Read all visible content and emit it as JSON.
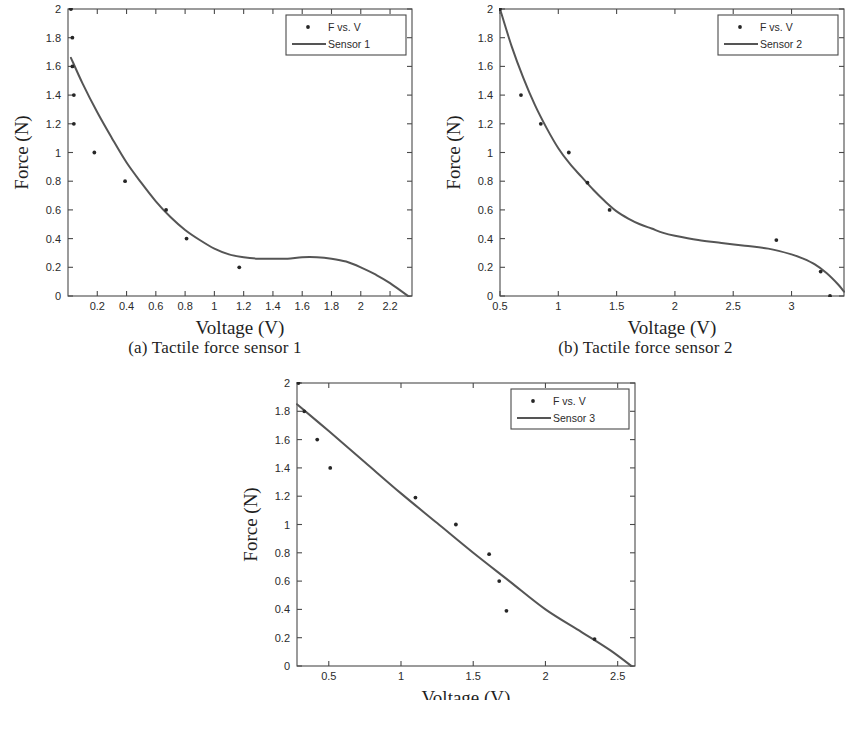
{
  "figure": {
    "background_color": "#ffffff",
    "ink_color": "#333333"
  },
  "panels": [
    {
      "id": "a",
      "caption": "(a) Tactile force sensor 1",
      "xlabel": "Voltage (V)",
      "ylabel": "Force (N)",
      "legend": {
        "marker_label": "F vs. V",
        "line_label": "Sensor 1"
      }
    },
    {
      "id": "b",
      "caption": "(b) Tactile force sensor 2",
      "xlabel": "Voltage (V)",
      "ylabel": "Force (N)",
      "legend": {
        "marker_label": "F vs. V",
        "line_label": "Sensor 2"
      }
    },
    {
      "id": "c",
      "caption": "(c) Tactile force sensor 3",
      "xlabel": "Voltage (V)",
      "ylabel": "Force (N)",
      "legend": {
        "marker_label": "F vs. V",
        "line_label": "Sensor 3"
      }
    }
  ],
  "chart_data": [
    {
      "type": "scatter",
      "id": "a",
      "title": "(a) Tactile force sensor 1",
      "xlabel": "Voltage (V)",
      "ylabel": "Force (N)",
      "xlim": [
        0.0,
        2.35
      ],
      "ylim": [
        0,
        2
      ],
      "xticks": [
        0.2,
        0.4,
        0.6,
        0.8,
        1,
        1.2,
        1.4,
        1.6,
        1.8,
        2,
        2.2
      ],
      "xtick_labels": [
        "0.2",
        "0.4",
        "0.6",
        "0.8",
        "1",
        "1.2",
        "1.4",
        "1.6",
        "1.8",
        "2",
        "2.2"
      ],
      "yticks": [
        0,
        0.2,
        0.4,
        0.6,
        0.8,
        1,
        1.2,
        1.4,
        1.6,
        1.8,
        2
      ],
      "ytick_labels": [
        "0",
        "0.2",
        "0.4",
        "0.6",
        "0.8",
        "1",
        "1.2",
        "1.4",
        "1.6",
        "1.8",
        "2"
      ],
      "grid": false,
      "legend_position": "top-right",
      "series": [
        {
          "name": "F vs. V",
          "kind": "scatter",
          "points": [
            [
              0.02,
              2.0
            ],
            [
              0.03,
              1.8
            ],
            [
              0.03,
              1.6
            ],
            [
              0.04,
              1.4
            ],
            [
              0.04,
              1.2
            ],
            [
              0.18,
              1.0
            ],
            [
              0.39,
              0.8
            ],
            [
              0.67,
              0.6
            ],
            [
              0.81,
              0.4
            ],
            [
              1.17,
              0.2
            ]
          ]
        },
        {
          "name": "Sensor 1",
          "kind": "fit-curve",
          "points": [
            [
              0.02,
              1.66
            ],
            [
              0.1,
              1.48
            ],
            [
              0.2,
              1.28
            ],
            [
              0.3,
              1.1
            ],
            [
              0.4,
              0.93
            ],
            [
              0.5,
              0.79
            ],
            [
              0.6,
              0.66
            ],
            [
              0.7,
              0.55
            ],
            [
              0.8,
              0.46
            ],
            [
              0.9,
              0.39
            ],
            [
              1.0,
              0.33
            ],
            [
              1.1,
              0.29
            ],
            [
              1.2,
              0.27
            ],
            [
              1.3,
              0.26
            ],
            [
              1.4,
              0.26
            ],
            [
              1.5,
              0.26
            ],
            [
              1.6,
              0.27
            ],
            [
              1.7,
              0.27
            ],
            [
              1.8,
              0.26
            ],
            [
              1.9,
              0.24
            ],
            [
              2.0,
              0.2
            ],
            [
              2.1,
              0.15
            ],
            [
              2.2,
              0.09
            ],
            [
              2.35,
              -0.02
            ]
          ]
        }
      ]
    },
    {
      "type": "scatter",
      "id": "b",
      "title": "(b) Tactile force sensor 2",
      "xlabel": "Voltage (V)",
      "ylabel": "Force (N)",
      "xlim": [
        0.5,
        3.45
      ],
      "ylim": [
        0,
        2
      ],
      "xticks": [
        0.5,
        1,
        1.5,
        2,
        2.5,
        3
      ],
      "xtick_labels": [
        "0.5",
        "1",
        "1.5",
        "2",
        "2.5",
        "3"
      ],
      "yticks": [
        0,
        0.2,
        0.4,
        0.6,
        0.8,
        1,
        1.2,
        1.4,
        1.6,
        1.8,
        2
      ],
      "ytick_labels": [
        "0",
        "0.2",
        "0.4",
        "0.6",
        "0.8",
        "1",
        "1.2",
        "1.4",
        "1.6",
        "1.8",
        "2"
      ],
      "grid": false,
      "legend_position": "top-right",
      "series": [
        {
          "name": "F vs. V",
          "kind": "scatter",
          "points": [
            [
              0.5,
              2.0
            ],
            [
              0.68,
              1.4
            ],
            [
              0.85,
              1.2
            ],
            [
              1.09,
              1.0
            ],
            [
              1.25,
              0.79
            ],
            [
              1.44,
              0.6
            ],
            [
              2.87,
              0.39
            ],
            [
              3.25,
              0.17
            ],
            [
              3.33,
              0.0
            ]
          ]
        },
        {
          "name": "Sensor 2",
          "kind": "fit-curve",
          "points": [
            [
              0.5,
              2.0
            ],
            [
              0.6,
              1.74
            ],
            [
              0.7,
              1.52
            ],
            [
              0.8,
              1.33
            ],
            [
              0.9,
              1.17
            ],
            [
              1.0,
              1.03
            ],
            [
              1.1,
              0.92
            ],
            [
              1.2,
              0.83
            ],
            [
              1.3,
              0.74
            ],
            [
              1.4,
              0.66
            ],
            [
              1.5,
              0.59
            ],
            [
              1.6,
              0.54
            ],
            [
              1.7,
              0.5
            ],
            [
              1.8,
              0.47
            ],
            [
              1.9,
              0.44
            ],
            [
              2.0,
              0.42
            ],
            [
              2.2,
              0.39
            ],
            [
              2.4,
              0.37
            ],
            [
              2.6,
              0.35
            ],
            [
              2.8,
              0.33
            ],
            [
              3.0,
              0.29
            ],
            [
              3.1,
              0.26
            ],
            [
              3.2,
              0.22
            ],
            [
              3.3,
              0.16
            ],
            [
              3.4,
              0.08
            ],
            [
              3.45,
              0.03
            ]
          ]
        }
      ]
    },
    {
      "type": "scatter",
      "id": "c",
      "title": "(c) Tactile force sensor 3",
      "xlabel": "Voltage (V)",
      "ylabel": "Force (N)",
      "xlim": [
        0.28,
        2.62
      ],
      "ylim": [
        0,
        2
      ],
      "xticks": [
        0.5,
        1,
        1.5,
        2,
        2.5
      ],
      "xtick_labels": [
        "0.5",
        "1",
        "1.5",
        "2",
        "2.5"
      ],
      "yticks": [
        0,
        0.2,
        0.4,
        0.6,
        0.8,
        1,
        1.2,
        1.4,
        1.6,
        1.8,
        2
      ],
      "ytick_labels": [
        "0",
        "0.2",
        "0.4",
        "0.6",
        "0.8",
        "1",
        "1.2",
        "1.4",
        "1.6",
        "1.8",
        "2"
      ],
      "grid": false,
      "legend_position": "top-right",
      "series": [
        {
          "name": "F vs. V",
          "kind": "scatter",
          "points": [
            [
              0.29,
              2.0
            ],
            [
              0.33,
              1.8
            ],
            [
              0.42,
              1.6
            ],
            [
              0.51,
              1.4
            ],
            [
              1.1,
              1.19
            ],
            [
              1.38,
              1.0
            ],
            [
              1.61,
              0.79
            ],
            [
              1.68,
              0.6
            ],
            [
              1.73,
              0.39
            ],
            [
              2.34,
              0.19
            ]
          ]
        },
        {
          "name": "Sensor 3",
          "kind": "fit-curve",
          "points": [
            [
              0.28,
              1.85
            ],
            [
              0.5,
              1.66
            ],
            [
              0.75,
              1.44
            ],
            [
              1.0,
              1.22
            ],
            [
              1.25,
              1.01
            ],
            [
              1.5,
              0.8
            ],
            [
              1.75,
              0.6
            ],
            [
              2.0,
              0.4
            ],
            [
              2.25,
              0.24
            ],
            [
              2.45,
              0.11
            ],
            [
              2.62,
              -0.02
            ]
          ]
        }
      ]
    }
  ]
}
